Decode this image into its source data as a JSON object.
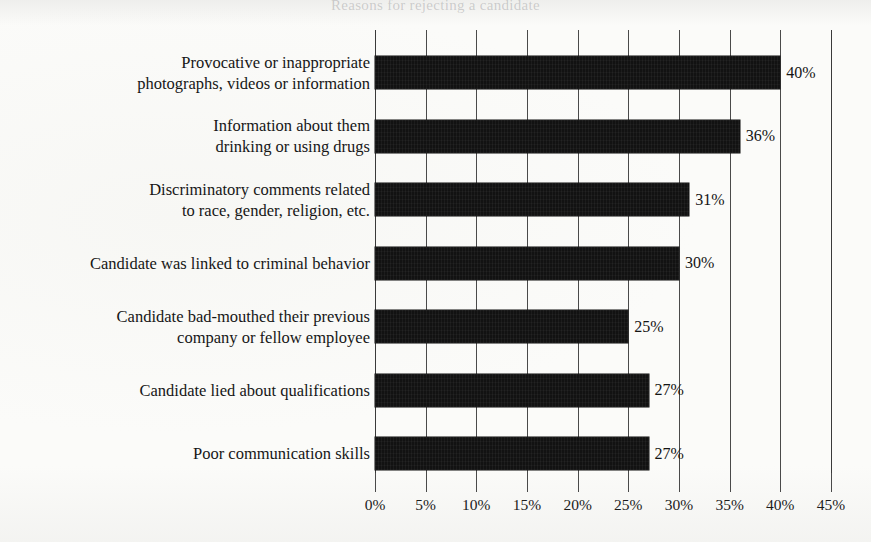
{
  "title_ghost": "Reasons for rejecting a candidate",
  "chart_data": {
    "type": "bar",
    "orientation": "horizontal",
    "title": "",
    "xlabel": "",
    "ylabel": "",
    "xlim": [
      0,
      45
    ],
    "grid": true,
    "legend": "none",
    "categories": [
      "Provocative or inappropriate\nphotographs, videos or information",
      "Information about them\ndrinking or using drugs",
      "Discriminatory comments related\nto race, gender, religion, etc.",
      "Candidate was linked to criminal behavior",
      "Candidate bad-mouthed their previous\ncompany or fellow employee",
      "Candidate lied about qualifications",
      "Poor communication skills"
    ],
    "values": [
      40,
      36,
      31,
      30,
      25,
      27,
      27
    ],
    "value_labels": [
      "40%",
      "36%",
      "31%",
      "30%",
      "25%",
      "27%",
      "27%"
    ],
    "xticks": [
      0,
      5,
      10,
      15,
      20,
      25,
      30,
      35,
      40,
      45
    ],
    "xticklabels": [
      "0%",
      "5%",
      "10%",
      "15%",
      "20%",
      "25%",
      "30%",
      "35%",
      "40%",
      "45%"
    ],
    "bar_color": "#121212",
    "background_color": "#fbfbf9",
    "axis_color": "#4a4a4a"
  }
}
